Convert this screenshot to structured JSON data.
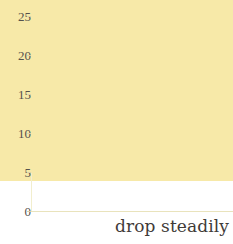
{
  "caption": {
    "text": "drop steadily"
  },
  "chart_data": {
    "type": "bar",
    "title": "",
    "subtitle": "",
    "xlabel": "",
    "ylabel": "",
    "categories": [
      "1",
      "2",
      "3",
      "4",
      "5",
      "6",
      "7",
      "8"
    ],
    "values": [
      23.2,
      20.1,
      16.9,
      13.7,
      11.4,
      8.7,
      6.3,
      3.4
    ],
    "series": [
      {
        "name": "values",
        "values": [
          23.2,
          20.1,
          16.9,
          13.7,
          11.4,
          8.7,
          6.3,
          3.4
        ]
      }
    ],
    "ylim": [
      0,
      25
    ],
    "ytick_labels": [
      "0",
      "5",
      "10",
      "15",
      "20",
      "25"
    ],
    "ytick_values": [
      0,
      5,
      10,
      15,
      20,
      25
    ],
    "xtick_labels": [],
    "grid": "horizontal",
    "legend": "none",
    "annotations": [
      "drop steadily"
    ],
    "colors": {
      "bar_fill": "#f7e9a8",
      "gridline": "#f0ecd2",
      "axis": "#f2eecd",
      "tick_text": "#56524c",
      "caption_text": "#3f3b38",
      "background": "#ffffff"
    }
  }
}
